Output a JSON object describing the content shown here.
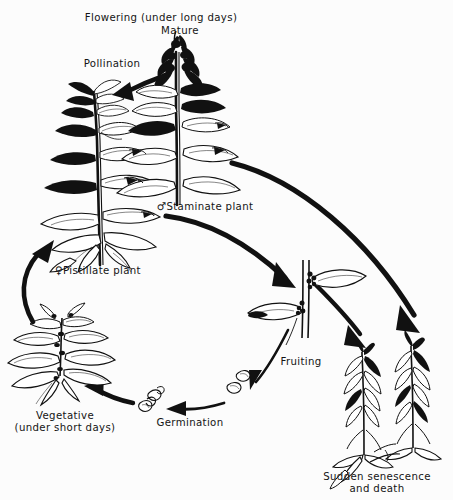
{
  "diagram": {
    "background_color": "#fcfcfc",
    "ink_color": "#141414",
    "labels": [
      {
        "id": "flowering",
        "name": "flowering-label",
        "text": "Flowering (under long days)",
        "x": 161,
        "y": 12,
        "align": "center"
      },
      {
        "id": "mature",
        "name": "mature-label",
        "text": "Mature",
        "x": 180,
        "y": 25,
        "align": "center"
      },
      {
        "id": "pollination",
        "name": "pollination-label",
        "text": "Pollination",
        "x": 112,
        "y": 58,
        "align": "center"
      },
      {
        "id": "staminate",
        "name": "staminate-plant-label",
        "symbol": "♂",
        "text": "Staminate plant",
        "x": 205,
        "y": 200,
        "align": "center"
      },
      {
        "id": "pistillate",
        "name": "pistillate-plant-label",
        "symbol": "♀",
        "text": "Pistillate plant",
        "x": 98,
        "y": 264,
        "align": "center"
      },
      {
        "id": "fruiting",
        "name": "fruiting-label",
        "text": "Fruiting",
        "x": 301,
        "y": 356,
        "align": "center"
      },
      {
        "id": "vegetative",
        "name": "vegetative-label",
        "text": "Vegetative\n(under short days)",
        "x": 65,
        "y": 410,
        "align": "center"
      },
      {
        "id": "germination",
        "name": "germination-label",
        "text": "Germination",
        "x": 190,
        "y": 417,
        "align": "center"
      },
      {
        "id": "senescence",
        "name": "senescence-label",
        "text": "Sudden senescence\nand death",
        "x": 377,
        "y": 471,
        "align": "center"
      }
    ],
    "stages": [
      {
        "id": "pistillate-plant",
        "name": "pistillate-plant-figure",
        "description": "Tall flowering female plant with dark shaded leaves"
      },
      {
        "id": "staminate-plant",
        "name": "staminate-plant-figure",
        "description": "Tall flowering male plant with dense terminal flower spike"
      },
      {
        "id": "fruiting-stem",
        "name": "fruiting-stem-figure",
        "description": "Upright stem bearing seed clusters at leaf axils"
      },
      {
        "id": "senescent-plants",
        "name": "senescent-plants-figure",
        "description": "Two withered drooping dead plants"
      },
      {
        "id": "seeds",
        "name": "seeds-figure",
        "description": "Shed seeds"
      },
      {
        "id": "germinating-seeds",
        "name": "germinating-seeds-figure",
        "description": "Seeds with emerging radicle"
      },
      {
        "id": "vegetative-rosette",
        "name": "vegetative-rosette-figure",
        "description": "Low leafy vegetative rosette under short days"
      }
    ],
    "arrows": [
      {
        "id": "pollination-arrow",
        "name": "pollination-arrow",
        "from": "staminate-plant",
        "to": "pistillate-plant",
        "style": "thick-straight"
      },
      {
        "id": "pistillate-to-fruiting",
        "name": "pistillate-to-fruiting-arrow",
        "from": "pistillate-plant",
        "to": "fruiting-stem",
        "style": "thick-curved"
      },
      {
        "id": "staminate-to-senescence",
        "name": "staminate-to-senescence-arrow",
        "from": "staminate-plant",
        "to": "senescent-plants",
        "style": "thick-curved"
      },
      {
        "id": "fruiting-to-senescence",
        "name": "fruiting-to-senescence-arrow",
        "from": "fruiting-stem",
        "to": "senescent-plants",
        "style": "thick-curved"
      },
      {
        "id": "fruiting-to-seeds",
        "name": "fruiting-to-seeds-arrow",
        "from": "fruiting-stem",
        "to": "seeds",
        "style": "thin-curved"
      },
      {
        "id": "seeds-to-germination",
        "name": "seeds-to-germination-arrow",
        "from": "seeds",
        "to": "germinating-seeds",
        "style": "thin-curved"
      },
      {
        "id": "germination-to-vegetative",
        "name": "germination-to-vegetative-arrow",
        "from": "germinating-seeds",
        "to": "vegetative-rosette",
        "style": "thick-curved"
      },
      {
        "id": "vegetative-to-pistillate",
        "name": "vegetative-to-pistillate-arrow",
        "from": "vegetative-rosette",
        "to": "pistillate-plant",
        "style": "thick-curved"
      }
    ]
  }
}
